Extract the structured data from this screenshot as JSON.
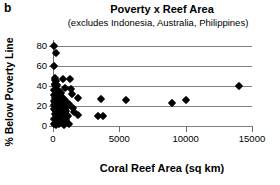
{
  "panel": {
    "letter": "b"
  },
  "chart_data": {
    "type": "scatter",
    "title": "Poverty x Reef Area",
    "subtitle": "(excludes Indonesia, Australia, Philippines)",
    "xlabel": "Coral Reef Area (sq km)",
    "ylabel": "% Below Poverty Line",
    "xlim": [
      0,
      15000
    ],
    "ylim": [
      0,
      80
    ],
    "xticks": [
      0,
      5000,
      10000,
      15000
    ],
    "xtick_labels": [
      "0",
      "5000",
      "10000",
      "15000"
    ],
    "yticks": [
      0,
      20,
      40,
      60,
      80
    ],
    "ytick_labels": [
      "0",
      "20",
      "40",
      "60",
      "80"
    ],
    "grid": true,
    "grid_axis": "y",
    "legend": null,
    "marker": "filled-diamond",
    "marker_color": "#000000",
    "series_name": "countries",
    "points": [
      [
        60,
        80
      ],
      [
        230,
        73
      ],
      [
        60,
        60
      ],
      [
        130,
        48
      ],
      [
        150,
        46
      ],
      [
        200,
        45
      ],
      [
        760,
        47
      ],
      [
        1270,
        47
      ],
      [
        120,
        42
      ],
      [
        170,
        41
      ],
      [
        250,
        40
      ],
      [
        300,
        41
      ],
      [
        940,
        38
      ],
      [
        1360,
        37
      ],
      [
        14050,
        40
      ],
      [
        60,
        36
      ],
      [
        200,
        35
      ],
      [
        330,
        34
      ],
      [
        430,
        35
      ],
      [
        640,
        33
      ],
      [
        1400,
        32
      ],
      [
        80,
        31
      ],
      [
        260,
        30
      ],
      [
        390,
        30
      ],
      [
        510,
        31
      ],
      [
        700,
        29
      ],
      [
        150,
        28
      ],
      [
        300,
        27
      ],
      [
        470,
        27
      ],
      [
        620,
        26
      ],
      [
        880,
        26
      ],
      [
        1850,
        28
      ],
      [
        3600,
        27
      ],
      [
        5500,
        26
      ],
      [
        60,
        25
      ],
      [
        140,
        24
      ],
      [
        230,
        24
      ],
      [
        310,
        23
      ],
      [
        420,
        24
      ],
      [
        560,
        23
      ],
      [
        700,
        22
      ],
      [
        900,
        23
      ],
      [
        1200,
        22
      ],
      [
        9000,
        23
      ],
      [
        10050,
        26
      ],
      [
        100,
        21
      ],
      [
        190,
        20
      ],
      [
        280,
        20
      ],
      [
        370,
        19
      ],
      [
        500,
        20
      ],
      [
        650,
        19
      ],
      [
        820,
        18
      ],
      [
        1050,
        19
      ],
      [
        1500,
        18
      ],
      [
        60,
        17
      ],
      [
        170,
        16
      ],
      [
        260,
        16
      ],
      [
        360,
        15
      ],
      [
        490,
        16
      ],
      [
        700,
        14
      ],
      [
        1000,
        15
      ],
      [
        1600,
        14
      ],
      [
        120,
        12
      ],
      [
        240,
        11
      ],
      [
        420,
        12
      ],
      [
        560,
        10
      ],
      [
        760,
        11
      ],
      [
        1100,
        10
      ],
      [
        1900,
        11
      ],
      [
        3400,
        10
      ],
      [
        3800,
        10
      ],
      [
        80,
        7
      ],
      [
        230,
        6
      ],
      [
        400,
        7
      ],
      [
        600,
        5
      ],
      [
        950,
        6
      ],
      [
        60,
        2
      ],
      [
        250,
        1
      ],
      [
        480,
        2
      ],
      [
        820,
        1
      ],
      [
        1200,
        2
      ]
    ]
  }
}
